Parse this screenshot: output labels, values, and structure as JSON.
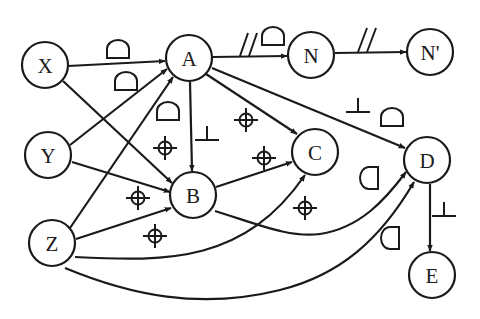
{
  "diagram": {
    "type": "directed-graph",
    "nodes": [
      {
        "id": "X",
        "label": "X",
        "x": 45,
        "y": 65
      },
      {
        "id": "A",
        "label": "A",
        "x": 189,
        "y": 58
      },
      {
        "id": "N",
        "label": "N",
        "x": 311,
        "y": 55
      },
      {
        "id": "Np",
        "label": "N'",
        "x": 430,
        "y": 52
      },
      {
        "id": "Y",
        "label": "Y",
        "x": 48,
        "y": 155
      },
      {
        "id": "B",
        "label": "B",
        "x": 193,
        "y": 195
      },
      {
        "id": "C",
        "label": "C",
        "x": 315,
        "y": 152
      },
      {
        "id": "D",
        "label": "D",
        "x": 427,
        "y": 160
      },
      {
        "id": "Z",
        "label": "Z",
        "x": 52,
        "y": 243
      },
      {
        "id": "E",
        "label": "E",
        "x": 432,
        "y": 275
      }
    ],
    "edges": [
      {
        "from": "X",
        "to": "A",
        "symbol": "d-shape"
      },
      {
        "from": "X",
        "to": "B",
        "symbol": "none"
      },
      {
        "from": "Y",
        "to": "A",
        "symbol": "d-shape"
      },
      {
        "from": "Y",
        "to": "B",
        "symbol": "crosshair"
      },
      {
        "from": "Z",
        "to": "A",
        "symbol": "d-shape"
      },
      {
        "from": "Z",
        "to": "B",
        "symbol": "crosshair"
      },
      {
        "from": "Z",
        "to": "C",
        "symbol": "crosshair"
      },
      {
        "from": "Z",
        "to": "D",
        "symbol": "d-shape"
      },
      {
        "from": "A",
        "to": "B",
        "symbol": "perpendicular"
      },
      {
        "from": "A",
        "to": "C",
        "symbol": "crosshair"
      },
      {
        "from": "A",
        "to": "D",
        "symbol": "perpendicular-and-d-shape"
      },
      {
        "from": "A",
        "to": "N",
        "symbol": "double-slash-and-d-shape"
      },
      {
        "from": "N",
        "to": "Np",
        "symbol": "double-slash"
      },
      {
        "from": "B",
        "to": "C",
        "symbol": "crosshair"
      },
      {
        "from": "B",
        "to": "D",
        "symbol": "d-shape"
      },
      {
        "from": "D",
        "to": "E",
        "symbol": "perpendicular"
      }
    ],
    "symbol_legend": {
      "d-shape": "semicircle-topped D glyph",
      "crosshair": "circle with cross",
      "perpendicular": "up tack ⊥",
      "double-slash": "//"
    }
  }
}
